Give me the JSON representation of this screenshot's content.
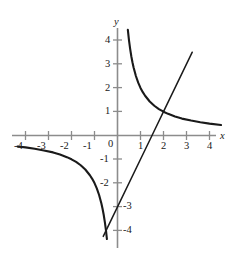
{
  "figure": {
    "background_color": "#ffffff",
    "axis_color": "#8c8c8c",
    "curve_color": "#1a1a1a",
    "label_color": "#202020",
    "x_axis_name": "x",
    "y_axis_name": "y",
    "origin_label": "0"
  },
  "chart_data": {
    "type": "line",
    "title": "",
    "xlabel": "x",
    "ylabel": "y",
    "xlim": [
      -4.7,
      4.8
    ],
    "ylim": [
      -4.6,
      4.7
    ],
    "grid": false,
    "legend": "none",
    "x_ticks": [
      -4,
      -3,
      -2,
      -1,
      0,
      1,
      2,
      3,
      4
    ],
    "x_tick_labels": [
      "-4",
      "-3",
      "-2",
      "-1",
      "0",
      "1",
      "2",
      "3",
      "4"
    ],
    "y_ticks": [
      -4,
      -3,
      -2,
      -1,
      1,
      2,
      3,
      4
    ],
    "y_tick_labels": [
      "-4",
      "-3",
      "-2",
      "-1",
      "1",
      "2",
      "3",
      "4"
    ],
    "y_tick_label_side": {
      "4": "left",
      "3": "left",
      "2": "left",
      "1": "left",
      "-1": "left",
      "-2": "left",
      "-3": "right",
      "-4": "right"
    },
    "series": [
      {
        "name": "hyperbola-right-branch",
        "equation": "y = 2/x",
        "x_range": [
          0.45,
          4.5
        ],
        "points": [
          [
            0.45,
            4.44
          ],
          [
            0.5,
            4.0
          ],
          [
            0.55,
            3.64
          ],
          [
            0.6,
            3.33
          ],
          [
            0.65,
            3.08
          ],
          [
            0.7,
            2.86
          ],
          [
            0.8,
            2.5
          ],
          [
            0.9,
            2.22
          ],
          [
            1.0,
            2.0
          ],
          [
            1.1,
            1.82
          ],
          [
            1.2,
            1.67
          ],
          [
            1.4,
            1.43
          ],
          [
            1.6,
            1.25
          ],
          [
            1.8,
            1.11
          ],
          [
            2.0,
            1.0
          ],
          [
            2.2,
            0.91
          ],
          [
            2.5,
            0.8
          ],
          [
            2.8,
            0.71
          ],
          [
            3.2,
            0.63
          ],
          [
            3.6,
            0.56
          ],
          [
            4.0,
            0.5
          ],
          [
            4.5,
            0.44
          ]
        ]
      },
      {
        "name": "hyperbola-left-branch",
        "equation": "y = 2/x",
        "x_range": [
          -4.35,
          -0.46
        ],
        "points": [
          [
            -4.35,
            -0.46
          ],
          [
            -4.0,
            -0.5
          ],
          [
            -3.6,
            -0.56
          ],
          [
            -3.2,
            -0.63
          ],
          [
            -2.8,
            -0.71
          ],
          [
            -2.5,
            -0.8
          ],
          [
            -2.2,
            -0.91
          ],
          [
            -2.0,
            -1.0
          ],
          [
            -1.8,
            -1.11
          ],
          [
            -1.6,
            -1.25
          ],
          [
            -1.4,
            -1.43
          ],
          [
            -1.2,
            -1.67
          ],
          [
            -1.1,
            -1.82
          ],
          [
            -1.0,
            -2.0
          ],
          [
            -0.9,
            -2.22
          ],
          [
            -0.8,
            -2.5
          ],
          [
            -0.7,
            -2.86
          ],
          [
            -0.65,
            -3.08
          ],
          [
            -0.6,
            -3.33
          ],
          [
            -0.55,
            -3.64
          ],
          [
            -0.5,
            -4.0
          ],
          [
            -0.46,
            -4.35
          ]
        ]
      },
      {
        "name": "straight-line",
        "equation": "y = 2x - 3",
        "x_range": [
          -0.62,
          3.25
        ],
        "points": [
          [
            -0.62,
            -4.24
          ],
          [
            0,
            -3.0
          ],
          [
            1.5,
            0
          ],
          [
            2,
            1.0
          ],
          [
            3.25,
            3.5
          ]
        ]
      }
    ],
    "intersection_points": [
      [
        2,
        1
      ]
    ],
    "annotations": []
  }
}
